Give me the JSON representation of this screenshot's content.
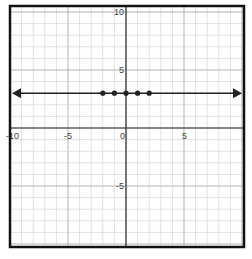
{
  "chart_data": {
    "type": "line",
    "title": "",
    "xlabel": "",
    "ylabel": "",
    "xlim": [
      -10,
      10
    ],
    "ylim": [
      -10,
      10
    ],
    "grid": true,
    "x_tick_labels": [
      {
        "value": -10,
        "label": "-10"
      },
      {
        "value": -5,
        "label": "-5"
      },
      {
        "value": 0,
        "label": "0"
      },
      {
        "value": 5,
        "label": "5"
      }
    ],
    "y_tick_labels": [
      {
        "value": 10,
        "label": "10"
      },
      {
        "value": 5,
        "label": "5"
      },
      {
        "value": -5,
        "label": "-5"
      }
    ],
    "series": [
      {
        "name": "horizontal line y=3",
        "kind": "line-with-arrows",
        "y": 3,
        "x_range": [
          -10,
          10
        ]
      },
      {
        "name": "points",
        "kind": "scatter",
        "points": [
          [
            -2,
            3
          ],
          [
            -1,
            3
          ],
          [
            0,
            3
          ],
          [
            1,
            3
          ],
          [
            2,
            3
          ]
        ]
      }
    ],
    "colors": {
      "line": "#222222",
      "grid": "#cccccc",
      "axis": "#333333",
      "frame": "#111111"
    }
  }
}
